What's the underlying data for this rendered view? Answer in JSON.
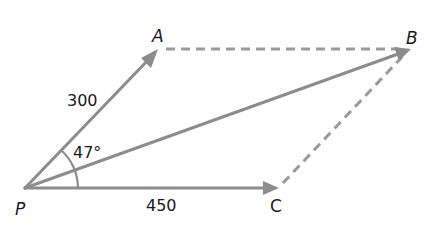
{
  "diagram": {
    "type": "vector parallelogram",
    "points": {
      "P": {
        "label": "P",
        "x": 25,
        "y": 188
      },
      "A": {
        "label": "A",
        "x": 158,
        "y": 49
      },
      "B": {
        "label": "B",
        "x": 410,
        "y": 49
      },
      "C": {
        "label": "C",
        "x": 278,
        "y": 188
      }
    },
    "vectors": [
      {
        "name": "PA",
        "from": "P",
        "to": "A",
        "style": "solid-arrow",
        "magnitude_label": "300"
      },
      {
        "name": "PC",
        "from": "P",
        "to": "C",
        "style": "solid-arrow",
        "magnitude_label": "450"
      },
      {
        "name": "PB",
        "from": "P",
        "to": "B",
        "style": "solid-arrow",
        "magnitude_label": ""
      }
    ],
    "dashed_edges": [
      {
        "name": "AB",
        "from": "A",
        "to": "B"
      },
      {
        "name": "CB",
        "from": "C",
        "to": "B"
      }
    ],
    "angle": {
      "label": "47°",
      "between": [
        "PA",
        "PC"
      ],
      "vertex": "P"
    },
    "labels": {
      "A": "A",
      "B": "B",
      "C": "C",
      "P": "P",
      "PA_magnitude": "300",
      "PC_magnitude": "450",
      "angle": "47°"
    },
    "colors": {
      "line": "#8c8c8c",
      "dashed": "#9a9a9a",
      "text": "#1a1a1a",
      "background": "#ffffff"
    }
  }
}
